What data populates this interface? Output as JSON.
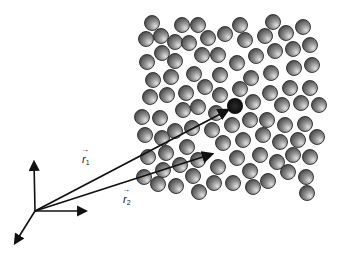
{
  "figure": {
    "labels": {
      "r1": {
        "symbol": "r",
        "subscript": "1"
      },
      "r2": {
        "symbol": "r",
        "subscript": "2"
      }
    },
    "axes": {
      "origin": [
        35,
        211
      ],
      "up_end": [
        34,
        162
      ],
      "right_end": [
        86,
        211
      ],
      "down_left_end": [
        15,
        243
      ]
    },
    "vectors": [
      {
        "name": "r1",
        "from": [
          35,
          211
        ],
        "to": [
          228,
          110
        ]
      },
      {
        "name": "r2",
        "from": [
          35,
          211
        ],
        "to": [
          212,
          154
        ]
      }
    ],
    "highlighted_particle": {
      "center": [
        235,
        106
      ],
      "radius": 8,
      "color": "#111111"
    },
    "particle_radius": 7.5,
    "particle_colors": {
      "light": "#d8d8d8",
      "mid": "#8a8a8a",
      "dark": "#3a3a3a",
      "outline": "#2a2a2a"
    },
    "particles": [
      [
        152,
        23
      ],
      [
        182,
        25
      ],
      [
        198,
        25
      ],
      [
        240,
        25
      ],
      [
        273,
        22
      ],
      [
        303,
        27
      ],
      [
        146,
        39
      ],
      [
        161,
        36
      ],
      [
        175,
        42
      ],
      [
        189,
        43
      ],
      [
        208,
        38
      ],
      [
        225,
        34
      ],
      [
        245,
        40
      ],
      [
        265,
        36
      ],
      [
        286,
        33
      ],
      [
        310,
        45
      ],
      [
        162,
        53
      ],
      [
        202,
        55
      ],
      [
        218,
        55
      ],
      [
        256,
        56
      ],
      [
        275,
        51
      ],
      [
        293,
        49
      ],
      [
        147,
        62
      ],
      [
        175,
        61
      ],
      [
        237,
        63
      ],
      [
        294,
        68
      ],
      [
        312,
        65
      ],
      [
        153,
        80
      ],
      [
        171,
        77
      ],
      [
        194,
        74
      ],
      [
        220,
        75
      ],
      [
        251,
        78
      ],
      [
        271,
        73
      ],
      [
        150,
        97
      ],
      [
        167,
        95
      ],
      [
        186,
        93
      ],
      [
        205,
        87
      ],
      [
        220,
        95
      ],
      [
        240,
        89
      ],
      [
        270,
        93
      ],
      [
        290,
        88
      ],
      [
        310,
        88
      ],
      [
        253,
        102
      ],
      [
        282,
        105
      ],
      [
        301,
        103
      ],
      [
        319,
        105
      ],
      [
        198,
        107
      ],
      [
        183,
        110
      ],
      [
        142,
        117
      ],
      [
        160,
        118
      ],
      [
        216,
        113
      ],
      [
        232,
        125
      ],
      [
        250,
        120
      ],
      [
        267,
        120
      ],
      [
        285,
        125
      ],
      [
        305,
        124
      ],
      [
        145,
        135
      ],
      [
        162,
        138
      ],
      [
        175,
        131
      ],
      [
        192,
        128
      ],
      [
        212,
        130
      ],
      [
        263,
        135
      ],
      [
        223,
        143
      ],
      [
        243,
        140
      ],
      [
        280,
        142
      ],
      [
        298,
        140
      ],
      [
        317,
        137
      ],
      [
        148,
        157
      ],
      [
        166,
        153
      ],
      [
        187,
        147
      ],
      [
        237,
        158
      ],
      [
        260,
        155
      ],
      [
        277,
        162
      ],
      [
        293,
        155
      ],
      [
        310,
        157
      ],
      [
        163,
        170
      ],
      [
        180,
        165
      ],
      [
        198,
        160
      ],
      [
        218,
        167
      ],
      [
        250,
        171
      ],
      [
        288,
        172
      ],
      [
        144,
        177
      ],
      [
        158,
        184
      ],
      [
        176,
        186
      ],
      [
        193,
        176
      ],
      [
        214,
        183
      ],
      [
        233,
        183
      ],
      [
        253,
        187
      ],
      [
        268,
        181
      ],
      [
        306,
        177
      ],
      [
        199,
        192
      ],
      [
        307,
        193
      ]
    ]
  }
}
